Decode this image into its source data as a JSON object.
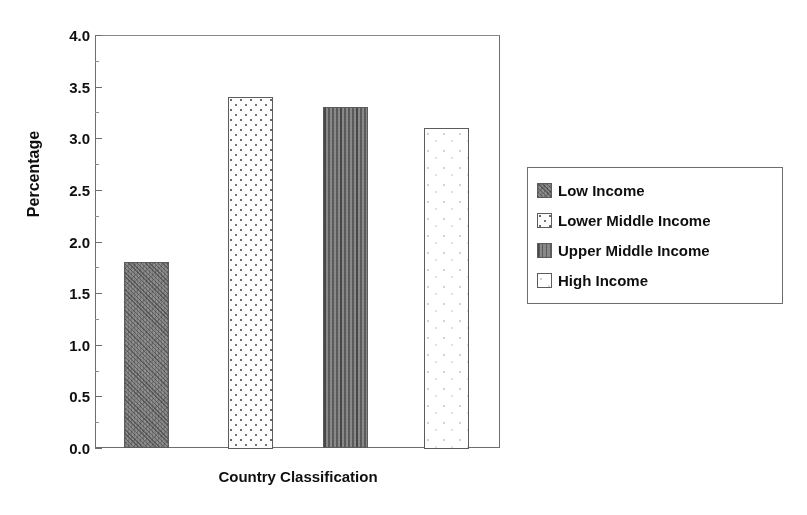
{
  "chart_data": {
    "type": "bar",
    "title": "",
    "subtitle": "",
    "xlabel": "Country Classification",
    "ylabel": "Percentage",
    "categories": [
      "Low Income",
      "Lower Middle Income",
      "Upper Middle Income",
      "High Income"
    ],
    "values": [
      1.8,
      3.4,
      3.3,
      3.1
    ],
    "series": [
      {
        "name": "Percentage",
        "values": [
          1.8,
          3.4,
          3.3,
          3.1
        ]
      }
    ],
    "ylim": [
      0.0,
      4.0
    ],
    "ytick_labels": [
      "0.0",
      "0.5",
      "1.0",
      "1.5",
      "2.0",
      "2.5",
      "3.0",
      "3.5",
      "4.0"
    ],
    "ytick_values": [
      0.0,
      0.5,
      1.0,
      1.5,
      2.0,
      2.5,
      3.0,
      3.5,
      4.0
    ],
    "xtick_labels": [],
    "grid": false,
    "legend_position": "right",
    "legend_entries": [
      {
        "label": "Low Income",
        "pattern": "dark-hatch",
        "value": 1.8
      },
      {
        "label": "Lower Middle Income",
        "pattern": "dots",
        "value": 3.4
      },
      {
        "label": "Upper Middle Income",
        "pattern": "vertical-stripes",
        "value": 3.3
      },
      {
        "label": "High Income",
        "pattern": "light",
        "value": 3.1
      }
    ],
    "colors": {
      "bar_low_income": "#8e8e8e",
      "bar_lower_middle_income": "#fbfbfb",
      "bar_upper_middle_income": "#8a8a8a",
      "bar_high_income": "#fdfdfd",
      "axis": "#6e6e6e",
      "text": "#111111",
      "background": "#ffffff"
    }
  }
}
